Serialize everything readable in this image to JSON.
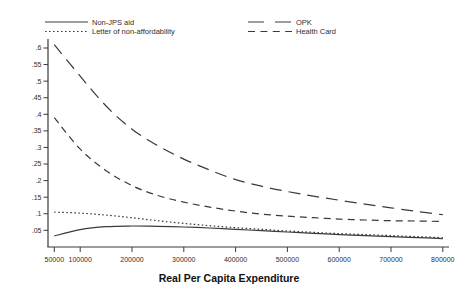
{
  "chart_data": {
    "type": "line",
    "title": "",
    "xlabel": "Real Per Capita Expenditure",
    "ylabel": "",
    "grid": false,
    "legend_position": "top",
    "xlim": [
      50000,
      800000
    ],
    "ylim": [
      0,
      0.64
    ],
    "x_ticks": [
      50000,
      100000,
      200000,
      300000,
      400000,
      500000,
      600000,
      700000,
      800000
    ],
    "x_tick_labels": [
      "50000",
      "100000",
      "200000",
      "300000",
      "400000",
      "500000",
      "600000",
      "700000",
      "800000"
    ],
    "y_ticks": [
      0.05,
      0.1,
      0.15,
      0.2,
      0.25,
      0.3,
      0.35,
      0.4,
      0.45,
      0.5,
      0.55,
      0.6
    ],
    "y_tick_labels": [
      ".05",
      ".1",
      ".15",
      ".2",
      ".25",
      ".3",
      ".35",
      ".4",
      ".45",
      ".5",
      ".55",
      ".6"
    ],
    "x": [
      50000,
      100000,
      150000,
      200000,
      250000,
      300000,
      350000,
      400000,
      450000,
      500000,
      550000,
      600000,
      650000,
      700000,
      750000,
      800000
    ],
    "series": [
      {
        "name": "Non-JPS aid",
        "line_style": "solid",
        "values": [
          0.033,
          0.052,
          0.061,
          0.063,
          0.062,
          0.06,
          0.057,
          0.053,
          0.049,
          0.045,
          0.041,
          0.037,
          0.034,
          0.031,
          0.028,
          0.025
        ]
      },
      {
        "name": "Letter of non-affordability",
        "line_style": "dotted",
        "values": [
          0.105,
          0.102,
          0.096,
          0.088,
          0.079,
          0.071,
          0.064,
          0.058,
          0.053,
          0.048,
          0.044,
          0.04,
          0.037,
          0.034,
          0.031,
          0.028
        ]
      },
      {
        "name": "OPK",
        "line_style": "long-dash",
        "values": [
          0.61,
          0.515,
          0.425,
          0.355,
          0.305,
          0.265,
          0.232,
          0.203,
          0.183,
          0.167,
          0.153,
          0.141,
          0.129,
          0.118,
          0.107,
          0.097
        ]
      },
      {
        "name": "Health Card",
        "line_style": "dash",
        "values": [
          0.39,
          0.295,
          0.23,
          0.185,
          0.155,
          0.135,
          0.12,
          0.108,
          0.099,
          0.093,
          0.088,
          0.084,
          0.081,
          0.079,
          0.078,
          0.077
        ]
      }
    ]
  },
  "legend": {
    "items": [
      {
        "label": "Non-JPS aid",
        "style": "solid"
      },
      {
        "label": "Letter of non-affordability",
        "style": "dotted"
      },
      {
        "label": "OPK",
        "style": "long-dash"
      },
      {
        "label": "Health Card",
        "style": "dash"
      }
    ]
  },
  "colors": {
    "line": "#3a3a3a",
    "text": "#2e2e2e",
    "background": "#ffffff"
  }
}
